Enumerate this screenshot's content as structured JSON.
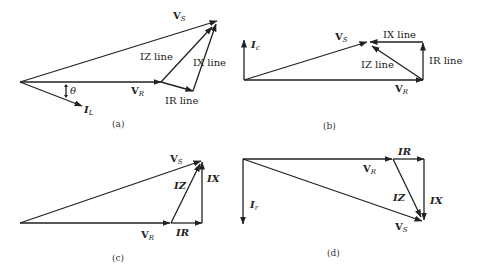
{
  "figure": {
    "panels": [
      {
        "id": "a",
        "caption": "(a)",
        "labels": {
          "vs": "V",
          "vs_sub": "S",
          "vr": "V",
          "vr_sub": "R",
          "il": "I",
          "il_sub": "L",
          "theta": "θ",
          "iz": "IZ line",
          "ix": "IX line",
          "ir": "IR line"
        }
      },
      {
        "id": "b",
        "caption": "(b)",
        "labels": {
          "ic": "I",
          "ic_sub": "c",
          "vs": "V",
          "vs_sub": "S",
          "vr": "V",
          "vr_sub": "R",
          "ix": "IX line",
          "ir": "IR line",
          "iz": "IZ line"
        }
      },
      {
        "id": "c",
        "caption": "(c)",
        "labels": {
          "vs": "V",
          "vs_sub": "S",
          "vr": "V",
          "vr_sub": "R",
          "iz": "IZ",
          "ix": "IX",
          "ir": "IR"
        }
      },
      {
        "id": "d",
        "caption": "(d)",
        "labels": {
          "ir_cur": "I",
          "ir_cur_sub": "r",
          "vs": "V",
          "vs_sub": "S",
          "vr": "V",
          "vr_sub": "R",
          "ir": "IR",
          "iz": "IZ",
          "ix": "IX"
        }
      }
    ]
  }
}
